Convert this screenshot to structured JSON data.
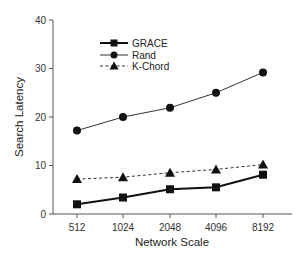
{
  "chart_data": {
    "type": "line",
    "title": "",
    "xlabel": "Network Scale",
    "ylabel": "Search Latency",
    "categories": [
      "512",
      "1024",
      "2048",
      "4096",
      "8192"
    ],
    "ylim": [
      0,
      40
    ],
    "yticks": [
      0,
      10,
      20,
      30,
      40
    ],
    "grid": false,
    "legend_position": "upper left (inside)",
    "series": [
      {
        "name": "GRACE",
        "marker": "square",
        "line": "solid",
        "values": [
          2.0,
          3.4,
          5.1,
          5.5,
          8.1
        ]
      },
      {
        "name": "Rand",
        "marker": "circle",
        "line": "solid-thin",
        "values": [
          17.2,
          20.0,
          21.9,
          25.0,
          29.2
        ]
      },
      {
        "name": "K-Chord",
        "marker": "triangle",
        "line": "dashed",
        "values": [
          7.2,
          7.6,
          8.5,
          9.2,
          10.2
        ]
      }
    ]
  }
}
